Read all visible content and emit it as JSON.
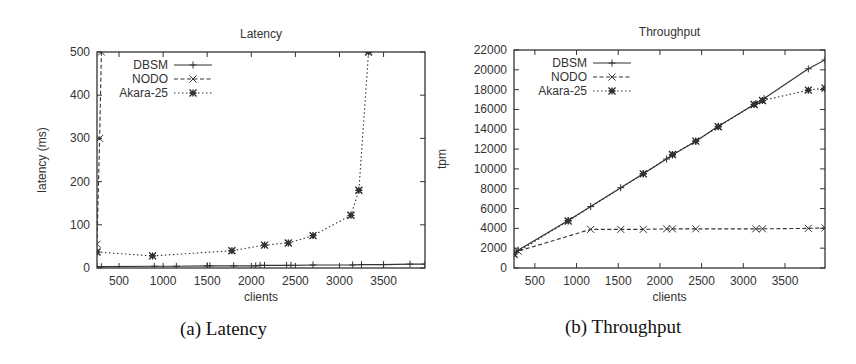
{
  "chart_data": [
    {
      "type": "line",
      "title": "Latency",
      "caption": "(a) Latency",
      "xlabel": "clients",
      "ylabel": "latency (ms)",
      "xlim": [
        250,
        3970
      ],
      "ylim": [
        0,
        500
      ],
      "xticks": [
        500,
        1000,
        1500,
        2000,
        2500,
        3000,
        3500
      ],
      "yticks": [
        0,
        100,
        200,
        300,
        400,
        500
      ],
      "grid": false,
      "legend_position": "top-left",
      "series": [
        {
          "name": "DBSM",
          "style": "solid",
          "marker": "plus",
          "x": [
            250,
            300,
            900,
            1150,
            1500,
            1530,
            1800,
            2050,
            2100,
            2150,
            2400,
            2450,
            2700,
            3150,
            3250,
            3500,
            3800,
            3970
          ],
          "y": [
            3,
            3,
            4,
            4,
            5,
            5,
            5,
            5,
            6,
            6,
            6,
            6,
            7,
            7,
            8,
            8,
            9,
            9
          ]
        },
        {
          "name": "NODO",
          "style": "dashed",
          "marker": "x",
          "x": [
            250,
            280,
            300
          ],
          "y": [
            55,
            300,
            500
          ]
        },
        {
          "name": "Akara-25",
          "style": "dotted",
          "marker": "star",
          "x": [
            250,
            880,
            1780,
            2150,
            2420,
            2700,
            3130,
            3220,
            3330
          ],
          "y": [
            37,
            28,
            40,
            53,
            58,
            75,
            122,
            180,
            500
          ]
        }
      ]
    },
    {
      "type": "line",
      "title": "Throughput",
      "caption": "(b) Throughput",
      "xlabel": "clients",
      "ylabel": "tpm",
      "xlim": [
        250,
        3980
      ],
      "ylim": [
        0,
        22000
      ],
      "xticks": [
        500,
        1000,
        1500,
        2000,
        2500,
        3000,
        3500
      ],
      "yticks": [
        0,
        2000,
        4000,
        6000,
        8000,
        10000,
        12000,
        14000,
        16000,
        18000,
        20000,
        22000
      ],
      "grid": false,
      "legend_position": "top-left",
      "series": [
        {
          "name": "DBSM",
          "style": "solid",
          "marker": "plus",
          "x": [
            250,
            300,
            900,
            1170,
            1530,
            1800,
            2080,
            2150,
            2430,
            2700,
            3150,
            3250,
            3780,
            3980
          ],
          "y": [
            1500,
            1800,
            4800,
            6200,
            8100,
            9500,
            11000,
            11400,
            12800,
            14300,
            16600,
            17100,
            20100,
            21000
          ]
        },
        {
          "name": "NODO",
          "style": "dashed",
          "marker": "x",
          "x": [
            250,
            300,
            1170,
            1530,
            1800,
            2080,
            2150,
            2430,
            3150,
            3230,
            3780,
            3980
          ],
          "y": [
            1400,
            1700,
            3900,
            3900,
            3900,
            3950,
            3950,
            3950,
            3950,
            3950,
            4000,
            4050
          ]
        },
        {
          "name": "Akara-25",
          "style": "dotted",
          "marker": "star",
          "x": [
            250,
            900,
            1800,
            2150,
            2430,
            2700,
            3130,
            3230,
            3780,
            3980
          ],
          "y": [
            1400,
            4750,
            9500,
            11450,
            12800,
            14250,
            16500,
            16900,
            17950,
            18150
          ]
        }
      ]
    }
  ]
}
